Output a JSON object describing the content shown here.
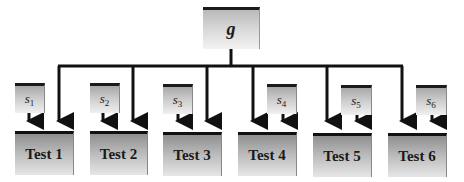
{
  "diagram": {
    "root": {
      "label": "g"
    },
    "specific_factors": [
      {
        "symbol": "s",
        "subscript": "1"
      },
      {
        "symbol": "s",
        "subscript": "2"
      },
      {
        "symbol": "s",
        "subscript": "3"
      },
      {
        "symbol": "s",
        "subscript": "4"
      },
      {
        "symbol": "s",
        "subscript": "5"
      },
      {
        "symbol": "s",
        "subscript": "6"
      }
    ],
    "tests": [
      {
        "label": "Test 1"
      },
      {
        "label": "Test 2"
      },
      {
        "label": "Test 3"
      },
      {
        "label": "Test 4"
      },
      {
        "label": "Test 5"
      },
      {
        "label": "Test 6"
      }
    ]
  }
}
